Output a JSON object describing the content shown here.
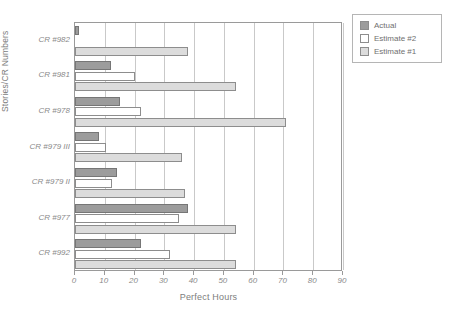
{
  "chart_data": {
    "type": "bar",
    "orientation": "horizontal",
    "title": "",
    "xlabel": "Perfect Hours",
    "ylabel": "Stories/CR Numbers",
    "xlim": [
      0,
      90
    ],
    "xticks": [
      0,
      10,
      20,
      30,
      40,
      50,
      60,
      70,
      80,
      90
    ],
    "xtick_labels": [
      "0",
      "10",
      "20",
      "30",
      "40",
      "50",
      "60",
      "70",
      "80",
      "90"
    ],
    "grid": true,
    "grid_axis": "x",
    "legend_position": "top-right",
    "categories": [
      "CR #982",
      "CR #981",
      "CR #978",
      "CR #979 III",
      "CR #979 II",
      "CR #977",
      "CR #992"
    ],
    "series": [
      {
        "name": "Actual",
        "color": "#9c9c9c",
        "values": [
          1.5,
          12,
          15,
          8,
          14,
          38,
          22
        ]
      },
      {
        "name": "Estimate #2",
        "color": "#ffffff",
        "values": [
          0,
          20,
          22,
          10.5,
          12.5,
          35,
          32
        ]
      },
      {
        "name": "Estimate #1",
        "color": "#dcdcdc",
        "values": [
          38,
          54,
          71,
          36,
          37,
          54,
          54
        ]
      }
    ]
  },
  "legend": {
    "items": [
      {
        "label": "Actual",
        "color": "#9c9c9c"
      },
      {
        "label": "Estimate #2",
        "color": "#ffffff"
      },
      {
        "label": "Estimate #1",
        "color": "#dcdcdc"
      }
    ]
  }
}
